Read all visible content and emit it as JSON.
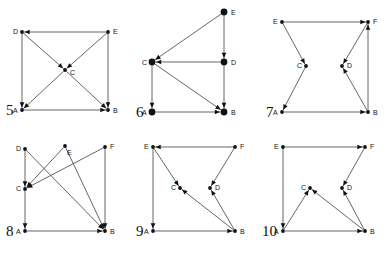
{
  "sheet": {
    "title": "",
    "figure_count": 6,
    "colors": {
      "background": "#ffffff",
      "edge": "#555555",
      "node": "#111111",
      "label": "#111111"
    }
  },
  "figures": [
    {
      "number": "5",
      "node_style": "small",
      "nodes": [
        {
          "id": "A",
          "label": "A",
          "x": 22,
          "y": 110,
          "label_dx": -9,
          "label_dy": 3
        },
        {
          "id": "B",
          "label": "B",
          "x": 108,
          "y": 110,
          "label_dx": 5,
          "label_dy": 3
        },
        {
          "id": "C",
          "label": "C",
          "x": 65,
          "y": 70,
          "label_dx": 5,
          "label_dy": 5
        },
        {
          "id": "D",
          "label": "D",
          "x": 22,
          "y": 32,
          "label_dx": -9,
          "label_dy": 2
        },
        {
          "id": "E",
          "label": "E",
          "x": 108,
          "y": 32,
          "label_dx": 5,
          "label_dy": 2
        }
      ],
      "edges": [
        {
          "from": "E",
          "to": "D",
          "arrow": true
        },
        {
          "from": "D",
          "to": "A",
          "arrow": true
        },
        {
          "from": "E",
          "to": "B",
          "arrow": true
        },
        {
          "from": "A",
          "to": "B",
          "arrow": true
        },
        {
          "from": "E",
          "to": "C",
          "arrow": true
        },
        {
          "from": "C",
          "to": "A",
          "arrow": true
        },
        {
          "from": "D",
          "to": "C",
          "arrow": true
        },
        {
          "from": "C",
          "to": "B",
          "arrow": true
        }
      ]
    },
    {
      "number": "6",
      "node_style": "large",
      "nodes": [
        {
          "id": "A",
          "label": "A",
          "x": 22,
          "y": 112,
          "label_dx": -10,
          "label_dy": 3
        },
        {
          "id": "B",
          "label": "B",
          "x": 94,
          "y": 112,
          "label_dx": 7,
          "label_dy": 3
        },
        {
          "id": "C",
          "label": "C",
          "x": 22,
          "y": 62,
          "label_dx": -10,
          "label_dy": 3
        },
        {
          "id": "D",
          "label": "D",
          "x": 94,
          "y": 62,
          "label_dx": 7,
          "label_dy": 3
        },
        {
          "id": "E",
          "label": "E",
          "x": 94,
          "y": 12,
          "label_dx": 7,
          "label_dy": 3
        }
      ],
      "edges": [
        {
          "from": "E",
          "to": "C",
          "arrow": true
        },
        {
          "from": "E",
          "to": "D",
          "arrow": true
        },
        {
          "from": "D",
          "to": "C",
          "arrow": true
        },
        {
          "from": "D",
          "to": "B",
          "arrow": true
        },
        {
          "from": "C",
          "to": "A",
          "arrow": true
        },
        {
          "from": "C",
          "to": "B",
          "arrow": true
        },
        {
          "from": "A",
          "to": "B",
          "arrow": true
        }
      ]
    },
    {
      "number": "7",
      "node_style": "small",
      "nodes": [
        {
          "id": "A",
          "label": "A",
          "x": 22,
          "y": 112,
          "label_dx": -9,
          "label_dy": 3
        },
        {
          "id": "B",
          "label": "B",
          "x": 108,
          "y": 112,
          "label_dx": 5,
          "label_dy": 3
        },
        {
          "id": "C",
          "label": "C",
          "x": 46,
          "y": 66,
          "label_dx": -9,
          "label_dy": 2
        },
        {
          "id": "D",
          "label": "D",
          "x": 82,
          "y": 66,
          "label_dx": 5,
          "label_dy": 2
        },
        {
          "id": "E",
          "label": "E",
          "x": 22,
          "y": 22,
          "label_dx": -9,
          "label_dy": 2
        },
        {
          "id": "F",
          "label": "F",
          "x": 108,
          "y": 22,
          "label_dx": 5,
          "label_dy": 2
        }
      ],
      "edges": [
        {
          "from": "E",
          "to": "F",
          "arrow": true
        },
        {
          "from": "E",
          "to": "C",
          "arrow": true
        },
        {
          "from": "C",
          "to": "A",
          "arrow": true
        },
        {
          "from": "A",
          "to": "B",
          "arrow": true
        },
        {
          "from": "F",
          "to": "D",
          "arrow": true
        },
        {
          "from": "B",
          "to": "D",
          "arrow": true
        },
        {
          "from": "B",
          "to": "F",
          "arrow": true
        }
      ]
    },
    {
      "number": "8",
      "node_style": "small",
      "nodes": [
        {
          "id": "A",
          "label": "A",
          "x": 25,
          "y": 95,
          "label_dx": -9,
          "label_dy": 3
        },
        {
          "id": "B",
          "label": "B",
          "x": 105,
          "y": 95,
          "label_dx": 5,
          "label_dy": 3
        },
        {
          "id": "C",
          "label": "C",
          "x": 25,
          "y": 53,
          "label_dx": -9,
          "label_dy": 2
        },
        {
          "id": "D",
          "label": "D",
          "x": 25,
          "y": 13,
          "label_dx": -9,
          "label_dy": 2
        },
        {
          "id": "E",
          "label": "E",
          "x": 65,
          "y": 10,
          "label_dx": 2,
          "label_dy": 9
        },
        {
          "id": "F",
          "label": "F",
          "x": 105,
          "y": 11,
          "label_dx": 5,
          "label_dy": 2
        }
      ],
      "edges": [
        {
          "from": "D",
          "to": "C",
          "arrow": true
        },
        {
          "from": "C",
          "to": "A",
          "arrow": true
        },
        {
          "from": "A",
          "to": "B",
          "arrow": true
        },
        {
          "from": "F",
          "to": "B",
          "arrow": true
        },
        {
          "from": "E",
          "to": "C",
          "arrow": true
        },
        {
          "from": "F",
          "to": "C",
          "arrow": true
        },
        {
          "from": "D",
          "to": "B",
          "arrow": true
        },
        {
          "from": "E",
          "to": "B",
          "arrow": true
        }
      ]
    },
    {
      "number": "9",
      "node_style": "small",
      "nodes": [
        {
          "id": "A",
          "label": "A",
          "x": 23,
          "y": 95,
          "label_dx": -9,
          "label_dy": 3
        },
        {
          "id": "B",
          "label": "B",
          "x": 105,
          "y": 95,
          "label_dx": 5,
          "label_dy": 3
        },
        {
          "id": "C",
          "label": "C",
          "x": 50,
          "y": 52,
          "label_dx": -9,
          "label_dy": 2
        },
        {
          "id": "D",
          "label": "D",
          "x": 80,
          "y": 52,
          "label_dx": 5,
          "label_dy": 2
        },
        {
          "id": "E",
          "label": "E",
          "x": 23,
          "y": 11,
          "label_dx": -9,
          "label_dy": 2
        },
        {
          "id": "F",
          "label": "F",
          "x": 105,
          "y": 11,
          "label_dx": 5,
          "label_dy": 2
        }
      ],
      "edges": [
        {
          "from": "F",
          "to": "E",
          "arrow": true
        },
        {
          "from": "E",
          "to": "A",
          "arrow": true
        },
        {
          "from": "A",
          "to": "B",
          "arrow": true
        },
        {
          "from": "F",
          "to": "D",
          "arrow": true
        },
        {
          "from": "B",
          "to": "D",
          "arrow": true
        },
        {
          "from": "E",
          "to": "C",
          "arrow": true
        },
        {
          "from": "B",
          "to": "C",
          "arrow": true
        }
      ]
    },
    {
      "number": "10",
      "node_style": "small",
      "nodes": [
        {
          "id": "A",
          "label": "A",
          "x": 23,
          "y": 95,
          "label_dx": -9,
          "label_dy": 3
        },
        {
          "id": "B",
          "label": "B",
          "x": 105,
          "y": 95,
          "label_dx": 5,
          "label_dy": 3
        },
        {
          "id": "C",
          "label": "C",
          "x": 50,
          "y": 52,
          "label_dx": -9,
          "label_dy": 2
        },
        {
          "id": "D",
          "label": "D",
          "x": 82,
          "y": 52,
          "label_dx": 5,
          "label_dy": 2
        },
        {
          "id": "E",
          "label": "E",
          "x": 23,
          "y": 11,
          "label_dx": -9,
          "label_dy": 2
        },
        {
          "id": "F",
          "label": "F",
          "x": 105,
          "y": 11,
          "label_dx": 5,
          "label_dy": 2
        }
      ],
      "edges": [
        {
          "from": "E",
          "to": "F",
          "arrow": true
        },
        {
          "from": "E",
          "to": "A",
          "arrow": true
        },
        {
          "from": "A",
          "to": "B",
          "arrow": true
        },
        {
          "from": "F",
          "to": "D",
          "arrow": true
        },
        {
          "from": "B",
          "to": "D",
          "arrow": true
        },
        {
          "from": "A",
          "to": "C",
          "arrow": true
        },
        {
          "from": "B",
          "to": "C",
          "arrow": true
        }
      ]
    }
  ],
  "layout": {
    "columns": 3,
    "rows": 2,
    "cell_width": 130,
    "cell_height": 136
  }
}
